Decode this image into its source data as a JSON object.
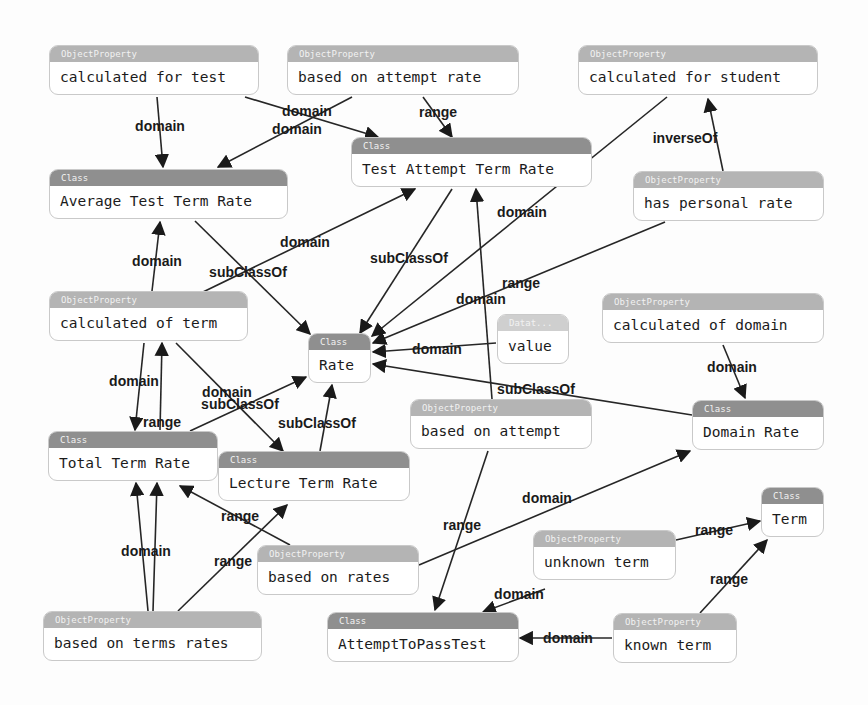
{
  "diagram": {
    "nodes": [
      {
        "id": "calc_for_test",
        "kind": "ObjectProperty",
        "header": "ObjectProperty",
        "label": "calculated for test",
        "x": 49,
        "y": 45,
        "w": 210,
        "h": 50
      },
      {
        "id": "based_attempt_rate",
        "kind": "ObjectProperty",
        "header": "ObjectProperty",
        "label": "based on attempt rate",
        "x": 287,
        "y": 45,
        "w": 232,
        "h": 50
      },
      {
        "id": "calc_for_student",
        "kind": "ObjectProperty",
        "header": "ObjectProperty",
        "label": "calculated for student",
        "x": 578,
        "y": 45,
        "w": 240,
        "h": 50
      },
      {
        "id": "test_attempt_term_rate",
        "kind": "Class",
        "header": "Class",
        "label": "Test Attempt Term Rate",
        "x": 351,
        "y": 137,
        "w": 241,
        "h": 50
      },
      {
        "id": "avg_test_term_rate",
        "kind": "Class",
        "header": "Class",
        "label": "Average Test Term Rate",
        "x": 49,
        "y": 169,
        "w": 239,
        "h": 50
      },
      {
        "id": "has_personal_rate",
        "kind": "ObjectProperty",
        "header": "ObjectProperty",
        "label": "has personal rate",
        "x": 633,
        "y": 171,
        "w": 191,
        "h": 50
      },
      {
        "id": "calc_of_term",
        "kind": "ObjectProperty",
        "header": "ObjectProperty",
        "label": "calculated of term",
        "x": 49,
        "y": 291,
        "w": 199,
        "h": 50
      },
      {
        "id": "calc_of_domain",
        "kind": "ObjectProperty",
        "header": "ObjectProperty",
        "label": "calculated of domain",
        "x": 602,
        "y": 293,
        "w": 222,
        "h": 50
      },
      {
        "id": "value",
        "kind": "DataProperty",
        "header": "Datat...",
        "label": "value",
        "x": 497,
        "y": 314,
        "w": 72,
        "h": 50
      },
      {
        "id": "rate",
        "kind": "Class",
        "header": "Class",
        "label": "Rate",
        "x": 308,
        "y": 333,
        "w": 63,
        "h": 50
      },
      {
        "id": "based_on_attempt",
        "kind": "ObjectProperty",
        "header": "ObjectProperty",
        "label": "based on attempt",
        "x": 410,
        "y": 399,
        "w": 182,
        "h": 50
      },
      {
        "id": "domain_rate",
        "kind": "Class",
        "header": "Class",
        "label": "Domain Rate",
        "x": 692,
        "y": 400,
        "w": 132,
        "h": 50
      },
      {
        "id": "total_term_rate",
        "kind": "Class",
        "header": "Class",
        "label": "Total Term Rate",
        "x": 48,
        "y": 431,
        "w": 170,
        "h": 50
      },
      {
        "id": "lecture_term_rate",
        "kind": "Class",
        "header": "Class",
        "label": "Lecture Term Rate",
        "x": 218,
        "y": 451,
        "w": 192,
        "h": 50
      },
      {
        "id": "term",
        "kind": "Class",
        "header": "Class",
        "label": "Term",
        "x": 761,
        "y": 487,
        "w": 63,
        "h": 50
      },
      {
        "id": "unknown_term",
        "kind": "ObjectProperty",
        "header": "ObjectProperty",
        "label": "unknown term",
        "x": 533,
        "y": 530,
        "w": 143,
        "h": 50
      },
      {
        "id": "based_on_rates",
        "kind": "ObjectProperty",
        "header": "ObjectProperty",
        "label": "based on rates",
        "x": 257,
        "y": 545,
        "w": 162,
        "h": 50
      },
      {
        "id": "based_on_terms_rates",
        "kind": "ObjectProperty",
        "header": "ObjectProperty",
        "label": "based on terms rates",
        "x": 43,
        "y": 611,
        "w": 219,
        "h": 50
      },
      {
        "id": "attempt_to_pass_test",
        "kind": "Class",
        "header": "Class",
        "label": "AttemptToPassTest",
        "x": 327,
        "y": 612,
        "w": 192,
        "h": 50
      },
      {
        "id": "known_term",
        "kind": "ObjectProperty",
        "header": "ObjectProperty",
        "label": "known term",
        "x": 613,
        "y": 613,
        "w": 124,
        "h": 50
      }
    ],
    "edges": [
      {
        "label": "domain",
        "from": "calc_for_test",
        "to": "avg_test_term_rate",
        "points": [
          [
            157,
            97
          ],
          [
            163,
            167
          ]
        ],
        "lx": 160,
        "ly": 126
      },
      {
        "label": "domain",
        "from": "calc_for_test",
        "to": "test_attempt_term_rate",
        "points": [
          [
            245,
            97
          ],
          [
            378,
            137
          ]
        ],
        "lx": 307,
        "ly": 111
      },
      {
        "label": "domain",
        "from": "based_attempt_rate",
        "to": "avg_test_term_rate",
        "points": [
          [
            352,
            97
          ],
          [
            218,
            167
          ]
        ],
        "lx": 297,
        "ly": 129
      },
      {
        "label": "range",
        "from": "based_attempt_rate",
        "to": "test_attempt_term_rate",
        "points": [
          [
            423,
            97
          ],
          [
            452,
            137
          ]
        ],
        "lx": 438,
        "ly": 112
      },
      {
        "label": "inverseOf",
        "from": "has_personal_rate",
        "to": "calc_for_student",
        "points": [
          [
            723,
            171
          ],
          [
            708,
            99
          ]
        ],
        "lx": 685,
        "ly": 138
      },
      {
        "label": "domain",
        "from": "calc_for_student",
        "to": "rate",
        "points": [
          [
            667,
            97
          ],
          [
            372,
            336
          ]
        ],
        "lx": 522,
        "ly": 212
      },
      {
        "label": "subClassOf",
        "from": "test_attempt_term_rate",
        "to": "rate",
        "points": [
          [
            452,
            189
          ],
          [
            360,
            333
          ]
        ],
        "lx": 409,
        "ly": 258
      },
      {
        "label": "domain",
        "from": "calc_of_term",
        "to": "test_attempt_term_rate",
        "points": [
          [
            203,
            292
          ],
          [
            415,
            189
          ]
        ],
        "lx": 305,
        "ly": 242
      },
      {
        "label": "subClassOf",
        "from": "avg_test_term_rate",
        "to": "rate",
        "points": [
          [
            195,
            221
          ],
          [
            310,
            334
          ]
        ],
        "lx": 248,
        "ly": 272
      },
      {
        "label": "domain",
        "from": "calc_of_term",
        "to": "avg_test_term_rate",
        "points": [
          [
            152,
            291
          ],
          [
            160,
            222
          ]
        ],
        "lx": 157,
        "ly": 261
      },
      {
        "label": "range",
        "from": "has_personal_rate",
        "to": "rate",
        "points": [
          [
            665,
            222
          ],
          [
            373,
            343
          ]
        ],
        "lx": 521,
        "ly": 283
      },
      {
        "label": "domain",
        "from": "based_on_attempt",
        "to": "test_attempt_term_rate",
        "points": [
          [
            492,
            399
          ],
          [
            476,
            189
          ]
        ],
        "lx": 481,
        "ly": 299
      },
      {
        "label": "domain",
        "from": "value",
        "to": "rate",
        "points": [
          [
            496,
            343
          ],
          [
            373,
            352
          ]
        ],
        "lx": 437,
        "ly": 349
      },
      {
        "label": "subClassOf",
        "from": "domain_rate",
        "to": "rate",
        "points": [
          [
            692,
            415
          ],
          [
            373,
            364
          ]
        ],
        "lx": 536,
        "ly": 389
      },
      {
        "label": "domain",
        "from": "calc_of_domain",
        "to": "domain_rate",
        "points": [
          [
            723,
            345
          ],
          [
            745,
            398
          ]
        ],
        "lx": 732,
        "ly": 367
      },
      {
        "label": "domain",
        "from": "calc_of_term",
        "to": "total_term_rate",
        "points": [
          [
            144,
            343
          ],
          [
            135,
            430
          ]
        ],
        "lx": 134,
        "ly": 381
      },
      {
        "label": "range",
        "from": "total_term_rate",
        "to": "calc_of_term",
        "points": [
          [
            160,
            430
          ],
          [
            162,
            343
          ]
        ],
        "lx": 162,
        "ly": 422
      },
      {
        "label": "domain",
        "from": "calc_of_term",
        "to": "lecture_term_rate",
        "points": [
          [
            176,
            343
          ],
          [
            283,
            451
          ]
        ],
        "lx": 227,
        "ly": 392
      },
      {
        "label": "subClassOf",
        "from": "total_term_rate",
        "to": "rate",
        "points": [
          [
            190,
            431
          ],
          [
            306,
            377
          ]
        ],
        "lx": 240,
        "ly": 404
      },
      {
        "label": "subClassOf",
        "from": "lecture_term_rate",
        "to": "rate",
        "points": [
          [
            320,
            451
          ],
          [
            332,
            385
          ]
        ],
        "lx": 317,
        "ly": 423
      },
      {
        "label": "domain",
        "from": "based_on_rates",
        "to": "domain_rate",
        "points": [
          [
            419,
            565
          ],
          [
            690,
            451
          ]
        ],
        "lx": 547,
        "ly": 498
      },
      {
        "label": "range",
        "from": "based_on_attempt",
        "to": "attempt_to_pass_test",
        "points": [
          [
            488,
            451
          ],
          [
            435,
            610
          ]
        ],
        "lx": 462,
        "ly": 525
      },
      {
        "label": "range",
        "from": "based_on_rates",
        "to": "total_term_rate",
        "points": [
          [
            290,
            545
          ],
          [
            180,
            486
          ]
        ],
        "lx": 240,
        "ly": 516
      },
      {
        "label": "range",
        "from": "based_on_terms_rates",
        "to": "lecture_term_rate",
        "points": [
          [
            178,
            611
          ],
          [
            287,
            505
          ]
        ],
        "lx": 233,
        "ly": 561
      },
      {
        "label": "domain",
        "from": "based_on_terms_rates",
        "to": "total_term_rate",
        "points": [
          [
            148,
            611
          ],
          [
            136,
            483
          ]
        ],
        "lx": 146,
        "ly": 551
      },
      {
        "label": "range",
        "from": "total_term_rate",
        "to": "based_on_terms_rates",
        "points": [
          [
            153,
            611
          ],
          [
            157,
            483
          ]
        ],
        "lx": 0,
        "ly": 0
      },
      {
        "label": "range",
        "from": "unknown_term",
        "to": "term",
        "points": [
          [
            676,
            540
          ],
          [
            760,
            521
          ]
        ],
        "lx": 714,
        "ly": 530
      },
      {
        "label": "range",
        "from": "known_term",
        "to": "term",
        "points": [
          [
            700,
            613
          ],
          [
            767,
            540
          ]
        ],
        "lx": 729,
        "ly": 579
      },
      {
        "label": "domain",
        "from": "known_term",
        "to": "attempt_to_pass_test",
        "points": [
          [
            612,
            638
          ],
          [
            520,
            638
          ]
        ],
        "lx": 568,
        "ly": 638
      },
      {
        "label": "domain",
        "from": "unknown_term",
        "to": "attempt_to_pass_test",
        "points": [
          [
            545,
            589
          ],
          [
            483,
            612
          ]
        ],
        "lx": 519,
        "ly": 594
      }
    ]
  }
}
